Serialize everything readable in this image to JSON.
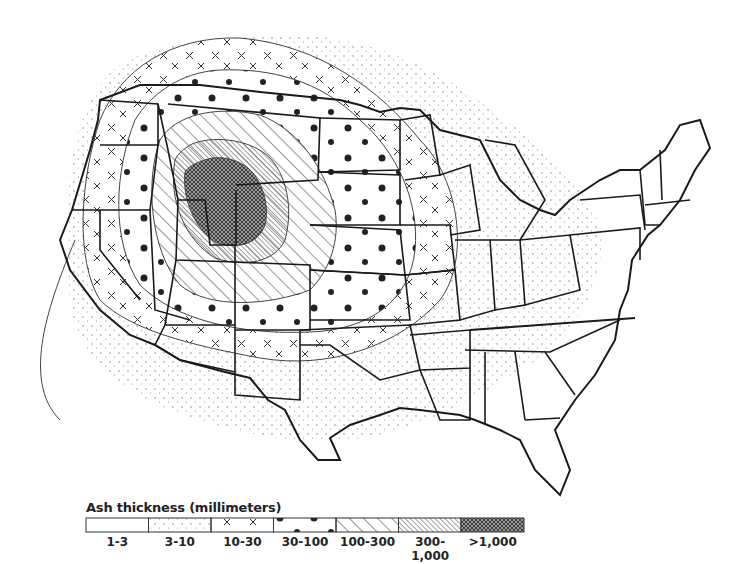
{
  "map": {
    "subject": "Ash fall distribution across the contiguous United States",
    "region": "Contiguous United States",
    "source_center": "Yellowstone (Wyoming/Idaho/Montana border)",
    "colors": {
      "background": "#ffffff",
      "ink": "#222222",
      "heavy": "#555555"
    }
  },
  "legend": {
    "title": "Ash thickness (millimeters)",
    "classes": [
      {
        "label": "1-3",
        "pattern": "blank",
        "fill": "#ffffff"
      },
      {
        "label": "3-10",
        "pattern": "fine-stipple",
        "fill": "url(#pStipple)"
      },
      {
        "label": "10-30",
        "pattern": "crosses",
        "fill": "url(#pCross)"
      },
      {
        "label": "30-100",
        "pattern": "dots",
        "fill": "url(#pDots)"
      },
      {
        "label": "100-300",
        "pattern": "wide-diagonal-hatch",
        "fill": "url(#pHatch)"
      },
      {
        "label": "300-1,000",
        "pattern": "dense-diagonal-hatch",
        "fill": "url(#pDense)"
      },
      {
        "label": ">1,000",
        "pattern": "crosshatch-dark",
        "fill": "url(#pCrossHatch)"
      }
    ]
  }
}
